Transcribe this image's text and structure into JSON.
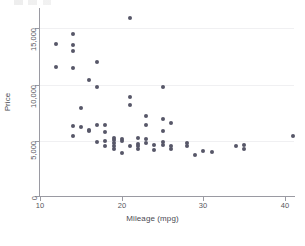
{
  "chart_data": {
    "type": "scatter",
    "title": "",
    "xlabel": "Mileage (mpg)",
    "ylabel": "Price",
    "xlim": [
      10,
      41.5
    ],
    "ylim": [
      0,
      16400
    ],
    "xticks": [
      10,
      20,
      30,
      40
    ],
    "xticklabels": [
      "10",
      "20",
      "30",
      "40"
    ],
    "yticks": [
      0,
      5000,
      10000,
      15000
    ],
    "yticklabels": [
      "0",
      "5,000",
      "10,000",
      "15,000"
    ],
    "grid": "horizontal-faint",
    "legend": "none",
    "marker": {
      "shape": "circle",
      "color": "#575768",
      "size_px": 4
    },
    "series": [
      {
        "name": "Price vs Mileage",
        "points": [
          [
            12,
            13594
          ],
          [
            12,
            11497
          ],
          [
            14,
            14500
          ],
          [
            14,
            13466
          ],
          [
            14,
            12990
          ],
          [
            14,
            11385
          ],
          [
            14,
            6229
          ],
          [
            14,
            5379
          ],
          [
            15,
            7827
          ],
          [
            15,
            6165
          ],
          [
            16,
            10372
          ],
          [
            16,
            5899
          ],
          [
            16,
            5788
          ],
          [
            17,
            11995
          ],
          [
            17,
            9735
          ],
          [
            17,
            6303
          ],
          [
            17,
            4816
          ],
          [
            18,
            6342
          ],
          [
            18,
            5705
          ],
          [
            18,
            4890
          ],
          [
            18,
            4453
          ],
          [
            19,
            5222
          ],
          [
            19,
            4999
          ],
          [
            19,
            4697
          ],
          [
            19,
            4424
          ],
          [
            19,
            4195
          ],
          [
            20,
            5079
          ],
          [
            20,
            4934
          ],
          [
            20,
            3829
          ],
          [
            21,
            15906
          ],
          [
            21,
            8814
          ],
          [
            21,
            8129
          ],
          [
            21,
            4504
          ],
          [
            22,
            5189
          ],
          [
            22,
            4647
          ],
          [
            22,
            4425
          ],
          [
            22,
            4172
          ],
          [
            23,
            7140
          ],
          [
            23,
            6295
          ],
          [
            23,
            5104
          ],
          [
            23,
            4723
          ],
          [
            24,
            4589
          ],
          [
            24,
            4082
          ],
          [
            25,
            9690
          ],
          [
            25,
            6850
          ],
          [
            25,
            5798
          ],
          [
            25,
            4816
          ],
          [
            25,
            4589
          ],
          [
            26,
            6486
          ],
          [
            26,
            4499
          ],
          [
            26,
            4187
          ],
          [
            28,
            4697
          ],
          [
            28,
            4482
          ],
          [
            29,
            3667
          ],
          [
            30,
            4060
          ],
          [
            31,
            3955
          ],
          [
            34,
            4425
          ],
          [
            35,
            4589
          ],
          [
            35,
            4181
          ],
          [
            41,
            5397
          ]
        ]
      }
    ]
  },
  "figure": {
    "background_color": "#ffffff",
    "axis_color": "#9a9aa2",
    "grid_color": "#f0f0f2",
    "text_color": "#55555c"
  }
}
